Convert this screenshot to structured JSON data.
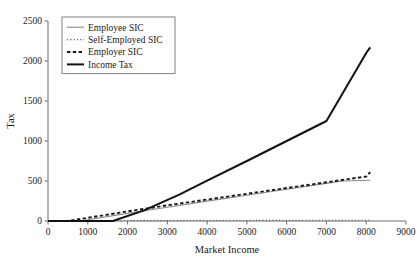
{
  "chart_data": {
    "type": "line",
    "title": "",
    "xlabel": "Market Income",
    "ylabel": "Tax",
    "xlim": [
      0,
      9000
    ],
    "ylim": [
      0,
      2500
    ],
    "xticks": [
      0,
      1000,
      2000,
      3000,
      4000,
      5000,
      6000,
      7000,
      8000,
      9000
    ],
    "yticks": [
      0,
      500,
      1000,
      1500,
      2000,
      2500
    ],
    "xtick_labels": [
      "0",
      "1000",
      "2000",
      "3000",
      "4000",
      "5000",
      "6000",
      "7000",
      "8000",
      "9000"
    ],
    "ytick_labels": [
      "0",
      "500",
      "1000",
      "1500",
      "2000",
      "2500"
    ],
    "grid": false,
    "legend_position": "upper-left-inside",
    "series": [
      {
        "name": "Employee SIC",
        "style": "solid",
        "color": "#8a8a8a",
        "width": 1.1,
        "x": [
          0,
          500,
          800,
          2000,
          3000,
          4000,
          5000,
          6000,
          7000,
          7400,
          8100
        ],
        "y": [
          0,
          0,
          0,
          95,
          172,
          248,
          322,
          396,
          470,
          500,
          510
        ]
      },
      {
        "name": "Self-Employed SIC",
        "style": "dotted",
        "color": "#555555",
        "width": 1.1,
        "x": [
          0,
          1000,
          2000,
          3000,
          4000,
          5000,
          6000,
          7000,
          8000,
          8100
        ],
        "y": [
          0,
          2,
          4,
          5,
          6,
          7,
          8,
          9,
          10,
          10
        ]
      },
      {
        "name": "Employer SIC",
        "style": "dashed",
        "color": "#1a1a1a",
        "width": 1.9,
        "x": [
          0,
          400,
          500,
          1000,
          2000,
          3000,
          4000,
          5000,
          6000,
          7000,
          8000,
          8100
        ],
        "y": [
          0,
          0,
          0,
          40,
          120,
          196,
          268,
          340,
          412,
          484,
          556,
          612
        ]
      },
      {
        "name": "Income Tax",
        "style": "solid",
        "color": "#111111",
        "width": 2.0,
        "x": [
          0,
          1630,
          2400,
          3300,
          4000,
          5000,
          6000,
          7000,
          8000,
          8100
        ],
        "y": [
          0,
          0,
          130,
          330,
          505,
          750,
          1000,
          1250,
          2100,
          2170
        ]
      }
    ]
  },
  "legend": {
    "entries": [
      {
        "label": "Employee SIC"
      },
      {
        "label": "Self-Employed SIC"
      },
      {
        "label": "Employer SIC"
      },
      {
        "label": "Income Tax"
      }
    ]
  }
}
